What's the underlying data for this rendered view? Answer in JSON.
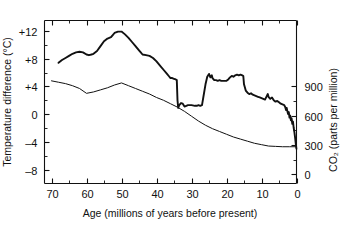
{
  "chart_data": {
    "type": "line",
    "title": "",
    "xlabel": "Age (millions of years before present)",
    "ylabel": "Temperature difference (°C)",
    "y2label": "CO₂ (parts per million)",
    "xlim": [
      72,
      0
    ],
    "x_inverted": true,
    "ylim": [
      -10,
      13.5
    ],
    "y2lim": [
      -10,
      13.5
    ],
    "grid": false,
    "legend_position": "none",
    "xticks": [
      70,
      60,
      50,
      40,
      30,
      20,
      10,
      0
    ],
    "xtick_labels": [
      "70",
      "60",
      "50",
      "40",
      "30",
      "20",
      "10",
      "0"
    ],
    "x_minor_ticks": [
      65,
      55,
      45,
      35,
      25,
      15,
      5
    ],
    "yticks": [
      12,
      8,
      4,
      0,
      -4,
      -8
    ],
    "ytick_labels": [
      "+12",
      "+8",
      "+4",
      "0",
      "–4",
      "–8"
    ],
    "y_minor_ticks": [
      10,
      6,
      2,
      -2,
      -6
    ],
    "y2ticks": [
      900,
      600,
      300,
      0
    ],
    "y2tick_labels": [
      "900",
      "600",
      "300",
      "0"
    ],
    "y2_minor_ticks": [
      750,
      450,
      150
    ],
    "y2_to_y_scale": {
      "note": "right axis 0 ppm maps to -8.7 degC, 900 ppm maps to +4.0 degC",
      "ppm_at_y_minus_8_7": 0,
      "ppm_at_y_plus_4": 900
    },
    "series": [
      {
        "name": "Temperature difference",
        "axis": "left",
        "units": "°C",
        "style": "thick",
        "points": [
          [
            68.0,
            7.4
          ],
          [
            67.0,
            7.8
          ],
          [
            66.0,
            8.1
          ],
          [
            65.0,
            8.4
          ],
          [
            64.0,
            8.7
          ],
          [
            63.0,
            8.9
          ],
          [
            62.0,
            9.0
          ],
          [
            61.0,
            8.9
          ],
          [
            60.0,
            8.6
          ],
          [
            59.3,
            8.5
          ],
          [
            58.6,
            8.6
          ],
          [
            58.0,
            8.7
          ],
          [
            57.0,
            9.1
          ],
          [
            56.0,
            9.8
          ],
          [
            55.0,
            10.5
          ],
          [
            54.0,
            10.9
          ],
          [
            53.0,
            11.1
          ],
          [
            52.5,
            11.4
          ],
          [
            52.0,
            11.7
          ],
          [
            51.0,
            11.9
          ],
          [
            50.0,
            11.9
          ],
          [
            49.0,
            11.5
          ],
          [
            48.0,
            11.0
          ],
          [
            47.0,
            10.4
          ],
          [
            46.0,
            9.8
          ],
          [
            45.0,
            9.2
          ],
          [
            44.5,
            8.9
          ],
          [
            44.0,
            8.6
          ],
          [
            43.0,
            8.5
          ],
          [
            42.0,
            8.4
          ],
          [
            41.0,
            8.1
          ],
          [
            40.0,
            7.6
          ],
          [
            39.0,
            7.0
          ],
          [
            38.0,
            6.4
          ],
          [
            37.0,
            5.8
          ],
          [
            36.5,
            5.5
          ],
          [
            36.0,
            5.2
          ],
          [
            35.5,
            5.2
          ],
          [
            35.0,
            5.1
          ],
          [
            34.5,
            5.0
          ],
          [
            34.2,
            4.9
          ],
          [
            34.0,
            2.0
          ],
          [
            33.8,
            0.9
          ],
          [
            33.5,
            1.3
          ],
          [
            33.0,
            1.6
          ],
          [
            32.5,
            1.5
          ],
          [
            32.0,
            1.1
          ],
          [
            31.5,
            1.2
          ],
          [
            31.0,
            1.3
          ],
          [
            30.0,
            1.3
          ],
          [
            29.0,
            1.2
          ],
          [
            28.5,
            1.2
          ],
          [
            28.0,
            1.3
          ],
          [
            27.5,
            1.2
          ],
          [
            27.0,
            1.3
          ],
          [
            26.5,
            2.8
          ],
          [
            26.0,
            4.3
          ],
          [
            25.5,
            5.4
          ],
          [
            25.0,
            5.8
          ],
          [
            24.6,
            5.3
          ],
          [
            24.2,
            5.6
          ],
          [
            24.0,
            5.2
          ],
          [
            23.5,
            4.9
          ],
          [
            23.0,
            4.9
          ],
          [
            22.5,
            4.8
          ],
          [
            22.0,
            4.9
          ],
          [
            21.5,
            4.8
          ],
          [
            21.0,
            4.8
          ],
          [
            20.0,
            4.8
          ],
          [
            19.5,
            5.0
          ],
          [
            19.0,
            5.3
          ],
          [
            18.5,
            5.5
          ],
          [
            18.0,
            5.4
          ],
          [
            17.5,
            5.6
          ],
          [
            17.0,
            5.7
          ],
          [
            16.5,
            5.6
          ],
          [
            16.0,
            5.7
          ],
          [
            15.5,
            5.6
          ],
          [
            15.2,
            5.5
          ],
          [
            15.0,
            4.3
          ],
          [
            14.5,
            3.4
          ],
          [
            14.0,
            3.1
          ],
          [
            13.5,
            2.9
          ],
          [
            13.0,
            3.0
          ],
          [
            12.5,
            2.8
          ],
          [
            12.0,
            2.7
          ],
          [
            11.5,
            2.6
          ],
          [
            11.0,
            2.5
          ],
          [
            10.5,
            2.4
          ],
          [
            10.0,
            2.3
          ],
          [
            9.5,
            2.2
          ],
          [
            9.0,
            2.1
          ],
          [
            8.5,
            2.6
          ],
          [
            8.2,
            2.9
          ],
          [
            8.0,
            2.5
          ],
          [
            7.5,
            2.2
          ],
          [
            7.0,
            2.4
          ],
          [
            6.5,
            2.0
          ],
          [
            6.0,
            1.8
          ],
          [
            5.5,
            1.9
          ],
          [
            5.0,
            1.7
          ],
          [
            4.5,
            1.5
          ],
          [
            4.0,
            1.4
          ],
          [
            3.5,
            1.3
          ],
          [
            3.2,
            1.0
          ],
          [
            3.0,
            0.6
          ],
          [
            2.8,
            0.9
          ],
          [
            2.6,
            0.4
          ],
          [
            2.4,
            0.0
          ],
          [
            2.2,
            0.3
          ],
          [
            2.0,
            -0.5
          ],
          [
            1.8,
            -0.2
          ],
          [
            1.6,
            -0.9
          ],
          [
            1.4,
            -0.6
          ],
          [
            1.2,
            -1.4
          ],
          [
            1.0,
            -1.1
          ],
          [
            0.8,
            -2.0
          ],
          [
            0.6,
            -2.6
          ],
          [
            0.4,
            -3.4
          ],
          [
            0.2,
            -4.3
          ],
          [
            0.05,
            -4.9
          ],
          [
            0.0,
            -5.0
          ]
        ]
      },
      {
        "name": "CO2 concentration",
        "axis": "right",
        "units": "ppm",
        "style": "thin",
        "points_degC_equivalent": [
          [
            70.0,
            4.8
          ],
          [
            68.0,
            4.6
          ],
          [
            66.0,
            4.4
          ],
          [
            64.0,
            4.1
          ],
          [
            62.0,
            3.7
          ],
          [
            60.0,
            3.0
          ],
          [
            58.0,
            3.2
          ],
          [
            56.0,
            3.5
          ],
          [
            54.0,
            3.8
          ],
          [
            52.0,
            4.2
          ],
          [
            50.0,
            4.5
          ],
          [
            48.0,
            4.1
          ],
          [
            46.0,
            3.7
          ],
          [
            44.0,
            3.3
          ],
          [
            42.0,
            2.9
          ],
          [
            40.0,
            2.4
          ],
          [
            38.0,
            2.0
          ],
          [
            36.0,
            1.5
          ],
          [
            34.0,
            1.0
          ],
          [
            32.0,
            0.4
          ],
          [
            30.0,
            -0.3
          ],
          [
            28.0,
            -1.0
          ],
          [
            26.0,
            -1.6
          ],
          [
            24.0,
            -2.1
          ],
          [
            22.0,
            -2.5
          ],
          [
            20.0,
            -2.9
          ],
          [
            18.0,
            -3.3
          ],
          [
            16.0,
            -3.6
          ],
          [
            14.0,
            -3.9
          ],
          [
            12.0,
            -4.2
          ],
          [
            10.0,
            -4.4
          ],
          [
            8.0,
            -4.6
          ],
          [
            6.0,
            -4.65
          ],
          [
            4.0,
            -4.7
          ],
          [
            2.0,
            -4.7
          ],
          [
            0.0,
            -4.7
          ]
        ],
        "approx_ppm": [
          [
            70,
            950
          ],
          [
            60,
            830
          ],
          [
            50,
            1030
          ],
          [
            40,
            880
          ],
          [
            34,
            780
          ],
          [
            30,
            590
          ],
          [
            20,
            410
          ],
          [
            10,
            305
          ],
          [
            5,
            285
          ],
          [
            0,
            280
          ]
        ]
      }
    ],
    "annotations": []
  }
}
